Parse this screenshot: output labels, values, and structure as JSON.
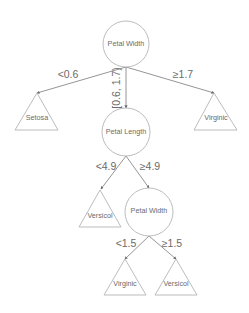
{
  "diagram": {
    "type": "decision-tree",
    "colors": {
      "node_stroke": "#b4b4b4",
      "edge_stroke": "#7a7a7a",
      "text": "#6a6a6a",
      "background": "#ffffff"
    },
    "nodes": {
      "root": {
        "label": "Petal Width",
        "shape": "circle"
      },
      "petal_length": {
        "label": "Petal Length",
        "shape": "circle"
      },
      "petal_width_2": {
        "label": "Petal Width",
        "shape": "circle"
      },
      "leaf_setosa": {
        "label": "Setosa",
        "shape": "triangle"
      },
      "leaf_virginic_top": {
        "label": "Virginic",
        "shape": "triangle"
      },
      "leaf_versicol_mid": {
        "label": "Versicol",
        "shape": "triangle"
      },
      "leaf_virginic_bottom": {
        "label": "Virginic",
        "shape": "triangle"
      },
      "leaf_versicol_bottom": {
        "label": "Versicol",
        "shape": "triangle"
      }
    },
    "edges": {
      "root_to_setosa": {
        "label": "<0.6",
        "from": "root",
        "to": "leaf_setosa"
      },
      "root_to_petal_length": {
        "label": "[0.6, 1.7)",
        "from": "root",
        "to": "petal_length"
      },
      "root_to_virginic": {
        "label": "≥1.7",
        "from": "root",
        "to": "leaf_virginic_top"
      },
      "pl_to_versicol": {
        "label": "<4.9",
        "from": "petal_length",
        "to": "leaf_versicol_mid"
      },
      "pl_to_petal_width": {
        "label": "≥4.9",
        "from": "petal_length",
        "to": "petal_width_2"
      },
      "pw2_to_virginic": {
        "label": "<1.5",
        "from": "petal_width_2",
        "to": "leaf_virginic_bottom"
      },
      "pw2_to_versicol": {
        "label": "≥1.5",
        "from": "petal_width_2",
        "to": "leaf_versicol_bottom"
      }
    }
  }
}
